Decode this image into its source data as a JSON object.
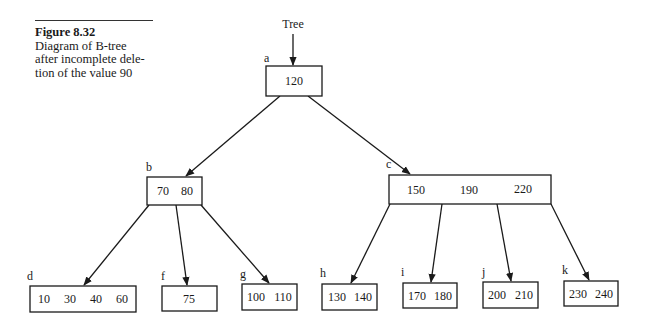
{
  "caption": {
    "figure": "Figure 8.32",
    "lines": [
      "Diagram of B-tree",
      "after incomplete dele-",
      "tion of the value 90"
    ]
  },
  "tree_pointer_label": "Tree",
  "nodes": {
    "a": {
      "label": "a",
      "keys": [
        "120"
      ]
    },
    "b": {
      "label": "b",
      "keys": [
        "70",
        "80"
      ]
    },
    "c": {
      "label": "c",
      "keys": [
        "150",
        "190",
        "220"
      ]
    },
    "d": {
      "label": "d",
      "keys": [
        "10",
        "30",
        "40",
        "60"
      ]
    },
    "f": {
      "label": "f",
      "keys": [
        "75"
      ]
    },
    "g": {
      "label": "g",
      "keys": [
        "100",
        "110"
      ]
    },
    "h": {
      "label": "h",
      "keys": [
        "130",
        "140"
      ]
    },
    "i": {
      "label": "i",
      "keys": [
        "170",
        "180"
      ]
    },
    "j": {
      "label": "j",
      "keys": [
        "200",
        "210"
      ]
    },
    "k": {
      "label": "k",
      "keys": [
        "230",
        "240"
      ]
    }
  },
  "edges": [
    {
      "from": "Tree",
      "to": "a"
    },
    {
      "from": "a",
      "to": "b"
    },
    {
      "from": "a",
      "to": "c"
    },
    {
      "from": "b",
      "to": "d"
    },
    {
      "from": "b",
      "to": "f"
    },
    {
      "from": "b",
      "to": "g"
    },
    {
      "from": "c",
      "to": "h"
    },
    {
      "from": "c",
      "to": "i"
    },
    {
      "from": "c",
      "to": "j"
    },
    {
      "from": "c",
      "to": "k"
    }
  ]
}
